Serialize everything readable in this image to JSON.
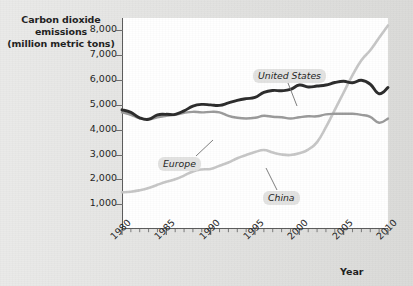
{
  "chart_data": {
    "type": "line",
    "title": "",
    "ylabel": "Carbon dioxide emissions (million metric tons)",
    "ylabel_lines": [
      "Carbon dioxide",
      "emissions",
      "(million metric tons)"
    ],
    "xlabel": "Year",
    "xlim": [
      1980,
      2010
    ],
    "ylim": [
      0,
      8500
    ],
    "grid": false,
    "legend_position": "inline-annotations",
    "y_ticks": [
      1000,
      2000,
      3000,
      4000,
      5000,
      6000,
      7000,
      8000
    ],
    "y_tick_labels": [
      "1,000",
      "2,000",
      "3,000",
      "4,000",
      "5,000",
      "6,000",
      "7,000",
      "8,000"
    ],
    "x_ticks": [
      1980,
      1985,
      1990,
      1995,
      2000,
      2005,
      2010
    ],
    "x_tick_labels": [
      "1980",
      "1985",
      "1990",
      "1995",
      "2000",
      "2005",
      "2010"
    ],
    "x_minor_tick_interval": 1,
    "x": [
      1980,
      1981,
      1982,
      1983,
      1984,
      1985,
      1986,
      1987,
      1988,
      1989,
      1990,
      1991,
      1992,
      1993,
      1994,
      1995,
      1996,
      1997,
      1998,
      1999,
      2000,
      2001,
      2002,
      2003,
      2004,
      2005,
      2006,
      2007,
      2008,
      2009,
      2010
    ],
    "series": [
      {
        "name": "United States",
        "color": "#2b2b2b",
        "values": [
          4800,
          4700,
          4480,
          4420,
          4600,
          4620,
          4620,
          4760,
          4950,
          5020,
          5000,
          4980,
          5080,
          5180,
          5250,
          5300,
          5500,
          5580,
          5570,
          5620,
          5800,
          5720,
          5760,
          5800,
          5900,
          5950,
          5890,
          5990,
          5830,
          5450,
          5700
        ]
      },
      {
        "name": "Europe",
        "color": "#9a9a9a",
        "values": [
          4700,
          4600,
          4460,
          4420,
          4500,
          4560,
          4600,
          4680,
          4720,
          4700,
          4720,
          4700,
          4560,
          4480,
          4450,
          4480,
          4560,
          4520,
          4500,
          4450,
          4500,
          4540,
          4540,
          4620,
          4640,
          4640,
          4640,
          4600,
          4520,
          4280,
          4450
        ]
      },
      {
        "name": "China",
        "color": "#c6c6c6",
        "values": [
          1480,
          1500,
          1560,
          1650,
          1780,
          1900,
          2000,
          2150,
          2320,
          2400,
          2420,
          2550,
          2680,
          2850,
          2980,
          3100,
          3180,
          3080,
          3000,
          2980,
          3050,
          3200,
          3500,
          4100,
          4800,
          5500,
          6200,
          6800,
          7200,
          7700,
          8200
        ]
      }
    ],
    "annotations": [
      {
        "name": "United States",
        "label": "United States"
      },
      {
        "name": "Europe",
        "label": "Europe"
      },
      {
        "name": "China",
        "label": "China"
      }
    ]
  },
  "axis": {
    "y_title_line1": "Carbon dioxide",
    "y_title_line2": "emissions",
    "y_title_line3": "(million metric tons)",
    "x_title": "Year"
  },
  "colors": {
    "background": "#dfdfdd",
    "plot_background": "#ffffff",
    "axis": "#595959",
    "united_states": "#2b2b2b",
    "europe": "#9a9a9a",
    "china": "#c6c6c6",
    "text": "#1d1d1d"
  }
}
